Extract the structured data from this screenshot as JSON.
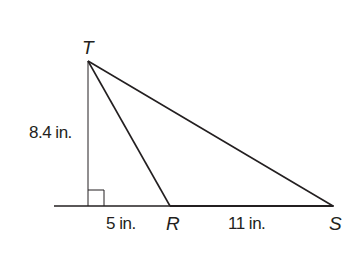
{
  "diagram": {
    "type": "triangle-geometry",
    "points": {
      "T": {
        "label": "T",
        "x": 88,
        "y": 61
      },
      "R": {
        "label": "R",
        "x": 170,
        "y": 206
      },
      "S": {
        "label": "S",
        "x": 333,
        "y": 206
      },
      "F": {
        "x": 88,
        "y": 206
      }
    },
    "labels": {
      "height": "8.4 in.",
      "foot_to_R": "5 in.",
      "R_to_S": "11 in.",
      "T": "T",
      "R": "R",
      "S": "S"
    },
    "right_angle_marker": true,
    "colors": {
      "line": "#231f20",
      "background": "#ffffff"
    }
  }
}
